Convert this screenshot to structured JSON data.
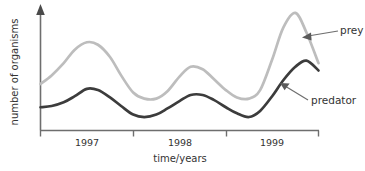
{
  "chart_data": {
    "type": "line",
    "title": "",
    "xlabel": "time/years",
    "ylabel": "number of organisms",
    "grid": false,
    "legend_position": "inline-annotations",
    "x_tick_labels": [
      "1997",
      "1998",
      "1999"
    ],
    "y_tick_labels": [],
    "xlim": [
      1996.5,
      1999.5
    ],
    "ylim": [
      0,
      100
    ],
    "y_axis_has_arrow": true,
    "series": [
      {
        "name": "prey",
        "color": "#bdbdbd",
        "x": [
          1996.5,
          1996.62,
          1996.75,
          1996.87,
          1997.0,
          1997.12,
          1997.25,
          1997.37,
          1997.5,
          1997.62,
          1997.75,
          1997.87,
          1998.0,
          1998.12,
          1998.25,
          1998.37,
          1998.5,
          1998.62,
          1998.75,
          1998.87,
          1999.0,
          1999.12,
          1999.25,
          1999.37,
          1999.5
        ],
        "values": [
          38,
          45,
          55,
          66,
          72,
          70,
          60,
          45,
          31,
          26,
          26,
          32,
          44,
          52,
          50,
          42,
          33,
          27,
          26,
          33,
          58,
          84,
          96,
          80,
          55
        ]
      },
      {
        "name": "predator",
        "color": "#3c3c3c",
        "x": [
          1996.5,
          1996.62,
          1996.75,
          1996.87,
          1997.0,
          1997.12,
          1997.25,
          1997.37,
          1997.5,
          1997.62,
          1997.75,
          1997.87,
          1998.0,
          1998.12,
          1998.25,
          1998.37,
          1998.5,
          1998.62,
          1998.75,
          1998.87,
          1999.0,
          1999.12,
          1999.25,
          1999.37,
          1999.5
        ],
        "values": [
          19,
          20,
          23,
          28,
          34,
          33,
          27,
          20,
          13,
          11,
          13,
          18,
          24,
          29,
          29,
          25,
          19,
          14,
          11,
          16,
          28,
          41,
          52,
          57,
          49
        ]
      }
    ],
    "annotations": [
      {
        "text": "prey",
        "target_series": "prey"
      },
      {
        "text": "predator",
        "target_series": "predator"
      }
    ]
  },
  "colors": {
    "prey": "#bdbdbd",
    "predator": "#3c3c3c",
    "axis": "#6e6e6e",
    "text": "#333333",
    "background": "#ffffff"
  }
}
